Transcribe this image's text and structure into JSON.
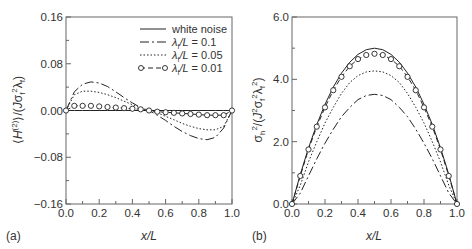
{
  "chart_data": [
    {
      "panel": "(a)",
      "type": "line",
      "xlabel": "x/L",
      "ylabel": "⟨H(2)⟩/(Jσf²λf)",
      "xlim": [
        0.0,
        1.0
      ],
      "ylim": [
        -0.16,
        0.16
      ],
      "xticks": [
        "0.0",
        "0.2",
        "0.4",
        "0.6",
        "0.8",
        "1.0"
      ],
      "yticks": [
        "0.16",
        "0.08",
        "0.00",
        "-0.08",
        "-0.16"
      ],
      "grid": false,
      "legend_position": "upper right",
      "x": [
        0.0,
        0.05,
        0.1,
        0.15,
        0.2,
        0.25,
        0.3,
        0.35,
        0.4,
        0.45,
        0.5,
        0.55,
        0.6,
        0.65,
        0.7,
        0.75,
        0.8,
        0.85,
        0.9,
        0.95,
        1.0
      ],
      "series": [
        {
          "name": "white noise",
          "style": "solid",
          "values": [
            0,
            0,
            0,
            0,
            0,
            0,
            0,
            0,
            0,
            0,
            0,
            0,
            0,
            0,
            0,
            0,
            0,
            0,
            0,
            0,
            0
          ]
        },
        {
          "name": "λf/L=0.1",
          "style": "dashdot",
          "values": [
            0,
            0.032,
            0.045,
            0.049,
            0.047,
            0.041,
            0.032,
            0.022,
            0.013,
            0.005,
            0,
            -0.008,
            -0.017,
            -0.027,
            -0.036,
            -0.043,
            -0.048,
            -0.05,
            -0.046,
            -0.03,
            0
          ]
        },
        {
          "name": "λf/L=0.05",
          "style": "dotted",
          "values": [
            0,
            0.027,
            0.033,
            0.033,
            0.031,
            0.027,
            0.022,
            0.016,
            0.01,
            0.004,
            0,
            -0.004,
            -0.01,
            -0.016,
            -0.022,
            -0.027,
            -0.031,
            -0.033,
            -0.033,
            -0.027,
            0
          ]
        },
        {
          "name": "λf/L=0.01",
          "style": "dash-circle",
          "values": [
            0,
            0.008,
            0.008,
            0.008,
            0.007,
            0.006,
            0.005,
            0.004,
            0.003,
            0.002,
            0,
            -0.002,
            -0.003,
            -0.004,
            -0.005,
            -0.006,
            -0.007,
            -0.008,
            -0.008,
            -0.008,
            0
          ]
        }
      ]
    },
    {
      "panel": "(b)",
      "type": "line",
      "xlabel": "x/L",
      "ylabel": "σh²/(J²σf²λf²)",
      "xlim": [
        0.0,
        1.0
      ],
      "ylim": [
        0.0,
        6.0
      ],
      "xticks": [
        "0.0",
        "0.2",
        "0.4",
        "0.6",
        "0.8",
        "1.0"
      ],
      "yticks": [
        "6.0",
        "4.0",
        "2.0",
        "0.0"
      ],
      "grid": false,
      "x": [
        0.0,
        0.05,
        0.1,
        0.15,
        0.2,
        0.25,
        0.3,
        0.35,
        0.4,
        0.45,
        0.5,
        0.55,
        0.6,
        0.65,
        0.7,
        0.75,
        0.8,
        0.85,
        0.9,
        0.95,
        1.0
      ],
      "series": [
        {
          "name": "white noise",
          "style": "solid",
          "values": [
            0,
            0.95,
            1.8,
            2.55,
            3.2,
            3.75,
            4.2,
            4.55,
            4.8,
            4.95,
            5.0,
            4.95,
            4.8,
            4.55,
            4.2,
            3.75,
            3.2,
            2.55,
            1.8,
            0.95,
            0
          ]
        },
        {
          "name": "λf/L=0.1",
          "style": "dashdot",
          "values": [
            0,
            0.35,
            0.9,
            1.45,
            1.95,
            2.4,
            2.8,
            3.1,
            3.35,
            3.48,
            3.52,
            3.48,
            3.35,
            3.1,
            2.8,
            2.4,
            1.95,
            1.45,
            0.9,
            0.35,
            0
          ]
        },
        {
          "name": "λf/L=0.05",
          "style": "dotted",
          "values": [
            0,
            0.6,
            1.35,
            2.0,
            2.6,
            3.1,
            3.55,
            3.9,
            4.12,
            4.24,
            4.27,
            4.24,
            4.12,
            3.9,
            3.55,
            3.1,
            2.6,
            2.0,
            1.35,
            0.6,
            0
          ]
        },
        {
          "name": "λf/L=0.01",
          "style": "dash-circle",
          "values": [
            0,
            0.9,
            1.75,
            2.48,
            3.1,
            3.65,
            4.08,
            4.42,
            4.65,
            4.78,
            4.82,
            4.78,
            4.65,
            4.42,
            4.08,
            3.65,
            3.1,
            2.48,
            1.75,
            0.9,
            0
          ]
        }
      ]
    }
  ],
  "labels": {
    "panel_a": "(a)",
    "panel_b": "(b)",
    "xlabel": "x/L"
  },
  "legend": [
    {
      "label": "white noise",
      "style": "solid"
    },
    {
      "label": "/L = 0.1",
      "symbol": "λ",
      "sub": "f",
      "style": "dashdot"
    },
    {
      "label": "/L = 0.05",
      "symbol": "λ",
      "sub": "f",
      "style": "dotted"
    },
    {
      "label": "/L = 0.01",
      "symbol": "λ",
      "sub": "f",
      "style": "dash-circle"
    }
  ],
  "colors": {
    "line": "#222222",
    "axis": "#555555",
    "text": "#333333"
  }
}
